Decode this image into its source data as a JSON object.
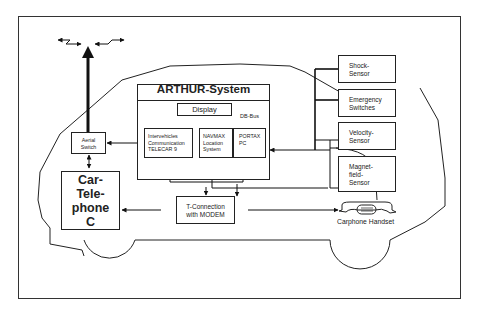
{
  "diagram": {
    "arthur_system": {
      "title": "ARTHUR-System",
      "display": "Display",
      "bus_label": "DB-Bus",
      "modules": [
        {
          "id": "telecar",
          "label": "Intervehicles\nCommunication\nTELECAR 9"
        },
        {
          "id": "navmax",
          "label": "NAVMAX\nLocation\nSystem"
        },
        {
          "id": "portax",
          "label": "PORTAX\nPC"
        }
      ]
    },
    "aerial_switch": "Aerial\nSwitch",
    "car_telephone": "Car-\nTele-\nphone\nC",
    "t_connection": "T-Connection\nwith MODEM",
    "carphone_handset": "Carphone Handset",
    "sensors": [
      {
        "id": "shock",
        "label": "Shock-\nSensor"
      },
      {
        "id": "emergency",
        "label": "Emergency\nSwitches"
      },
      {
        "id": "velocity",
        "label": "Velocity-\nSensor"
      },
      {
        "id": "magnet",
        "label": "Magnet-\nfield-\nSensor"
      }
    ],
    "icons": [
      "antenna-icon",
      "radio-wave-icon",
      "handset-icon",
      "car-outline"
    ]
  }
}
